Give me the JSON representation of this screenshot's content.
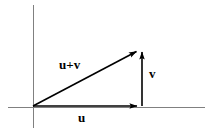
{
  "figure": {
    "width": 213,
    "height": 136,
    "background_color": "#ffffff"
  },
  "axes": {
    "color": "#808080",
    "stroke_width": 1,
    "origin": {
      "x": 33,
      "y": 107
    },
    "x_axis": {
      "x1": 8,
      "y1": 107,
      "x2": 205,
      "y2": 107
    },
    "y_axis": {
      "x1": 33,
      "y1": 5,
      "x2": 33,
      "y2": 128
    }
  },
  "vectors": [
    {
      "name": "u",
      "label": "u",
      "color": "#000000",
      "stroke_width": 1.6,
      "start": {
        "x": 33,
        "y": 106
      },
      "end": {
        "x": 142,
        "y": 106
      },
      "label_position": {
        "x": 84,
        "y": 118
      },
      "description": "horizontal vector u along x-axis"
    },
    {
      "name": "v",
      "label": "v",
      "color": "#000000",
      "stroke_width": 1.6,
      "start": {
        "x": 142,
        "y": 106
      },
      "end": {
        "x": 142,
        "y": 47
      },
      "label_position": {
        "x": 153,
        "y": 74
      },
      "description": "vertical vector v from tip of u"
    },
    {
      "name": "u+v",
      "label": "u+v",
      "color": "#000000",
      "stroke_width": 1.6,
      "start": {
        "x": 33,
        "y": 106
      },
      "end": {
        "x": 140,
        "y": 49
      },
      "label_position": {
        "x": 74,
        "y": 66
      },
      "description": "resultant diagonal vector u plus v"
    }
  ],
  "labels": {
    "u": "u",
    "v": "v",
    "u_plus_v": "u+v"
  }
}
